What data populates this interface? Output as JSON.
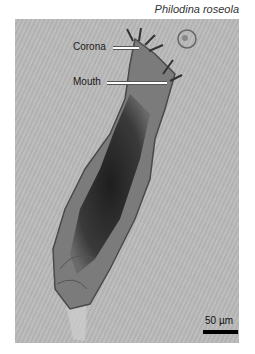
{
  "figure": {
    "species_name": "Philodina roseola",
    "labels": [
      {
        "text": "Corona"
      },
      {
        "text": "Mouth"
      }
    ],
    "scale_bar": {
      "text": "50 µm"
    },
    "colors": {
      "background": "#b9b9b9",
      "specimen_dark": "#2a2a2a",
      "scale_bar": "#000000"
    }
  }
}
